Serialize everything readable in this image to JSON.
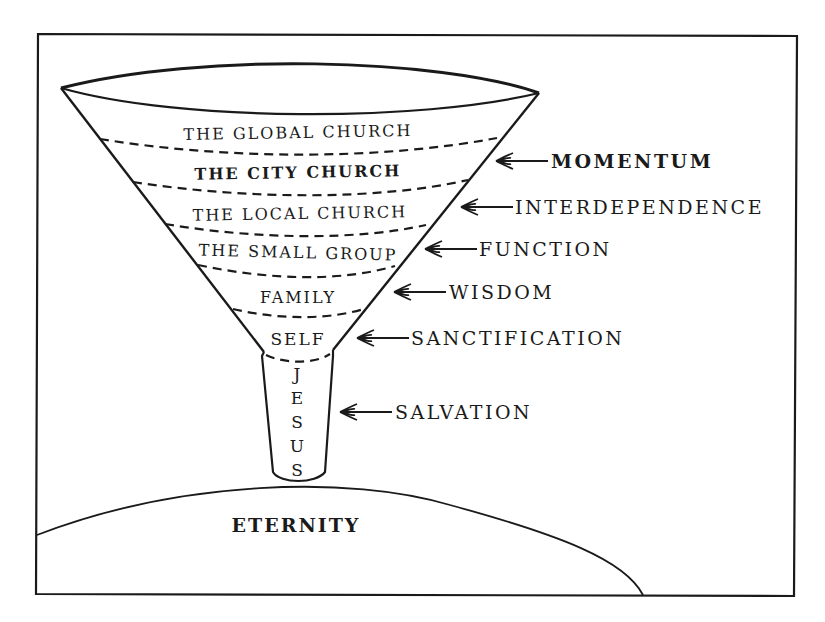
{
  "diagram": {
    "type": "funnel",
    "colors": {
      "ink": "#1a1a1a",
      "background": "#ffffff"
    },
    "funnel_layers": [
      {
        "label": "THE GLOBAL CHURCH",
        "bold": false
      },
      {
        "label": "THE CITY CHURCH",
        "bold": true
      },
      {
        "label": "THE LOCAL CHURCH",
        "bold": false
      },
      {
        "label": "THE SMALL GROUP",
        "bold": false
      },
      {
        "label": "FAMILY",
        "bold": false
      },
      {
        "label": "SELF",
        "bold": false
      }
    ],
    "tube": {
      "label": "JESUS",
      "letters": [
        "J",
        "E",
        "S",
        "U",
        "S"
      ]
    },
    "side_labels": [
      {
        "label": "MOMENTUM",
        "bold": true,
        "arrow": "arrow-left-icon"
      },
      {
        "label": "INTERDEPENDENCE",
        "bold": false,
        "arrow": "arrow-left-icon"
      },
      {
        "label": "FUNCTION",
        "bold": false,
        "arrow": "arrow-left-icon"
      },
      {
        "label": "WISDOM",
        "bold": false,
        "arrow": "arrow-left-icon"
      },
      {
        "label": "SANCTIFICATION",
        "bold": false,
        "arrow": "arrow-left-icon"
      },
      {
        "label": "SALVATION",
        "bold": false,
        "arrow": "arrow-left-icon"
      }
    ],
    "base": {
      "label": "ETERNITY"
    }
  }
}
